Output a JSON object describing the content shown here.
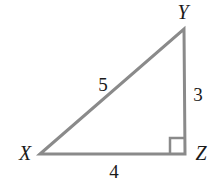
{
  "diagram": {
    "type": "right-triangle",
    "stroke_color": "#8a8a8a",
    "vertices": [
      {
        "name": "X",
        "x": 40,
        "y": 154,
        "label_x": 25,
        "label_y": 160
      },
      {
        "name": "Y",
        "x": 184,
        "y": 29,
        "label_x": 183,
        "label_y": 19
      },
      {
        "name": "Z",
        "x": 185,
        "y": 154,
        "label_x": 201,
        "label_y": 160
      }
    ],
    "sides": [
      {
        "between": "XY",
        "length": "5",
        "label_x": 103,
        "label_y": 91
      },
      {
        "between": "YZ",
        "length": "3",
        "label_x": 198,
        "label_y": 101
      },
      {
        "between": "XZ",
        "length": "4",
        "label_x": 114,
        "label_y": 178
      }
    ],
    "right_angle_at": "Z"
  }
}
